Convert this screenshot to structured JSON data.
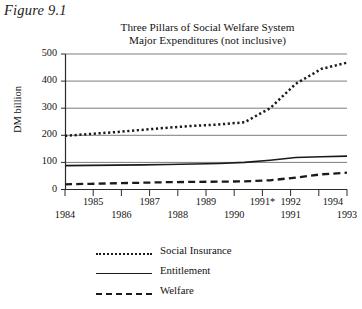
{
  "figure_label": "Figure 9.1",
  "title": {
    "line1": "Three Pillars of Social Welfare System",
    "line2": "Major Expenditures (not inclusive)"
  },
  "axes": {
    "ylabel": "DM billion",
    "y_ticks": [
      "500",
      "400",
      "300",
      "200",
      "100",
      "0"
    ],
    "x_ticks_upper": [
      "1985",
      "1987",
      "1989",
      "1991*",
      "1992",
      "1994"
    ],
    "x_ticks_lower": [
      "1984",
      "1986",
      "1988",
      "1990",
      "1991",
      "1993"
    ]
  },
  "legend": {
    "items": [
      {
        "label": "Social Insurance",
        "style": "dotted"
      },
      {
        "label": "Entitlement",
        "style": "solid"
      },
      {
        "label": "Welfare",
        "style": "dashed"
      }
    ]
  },
  "chart_data": {
    "type": "line",
    "xlabel": "",
    "ylabel": "DM billion",
    "ylim": [
      0,
      500
    ],
    "yticks": [
      0,
      100,
      200,
      300,
      400,
      500
    ],
    "grid": "horizontal",
    "legend_position": "below",
    "x": [
      "1984",
      "1985",
      "1986",
      "1987",
      "1988",
      "1989",
      "1990",
      "1991*",
      "1991",
      "1992",
      "1993",
      "1994"
    ],
    "series": [
      {
        "name": "Social Insurance",
        "style": "dotted",
        "values": [
          198,
          205,
          212,
          220,
          228,
          235,
          240,
          248,
          300,
          390,
          445,
          468
        ]
      },
      {
        "name": "Entitlement",
        "style": "solid",
        "values": [
          88,
          89,
          90,
          91,
          92,
          94,
          96,
          100,
          108,
          118,
          121,
          123
        ]
      },
      {
        "name": "Welfare",
        "style": "dashed",
        "values": [
          19,
          21,
          23,
          25,
          27,
          28,
          29,
          30,
          34,
          44,
          56,
          62
        ]
      }
    ]
  }
}
